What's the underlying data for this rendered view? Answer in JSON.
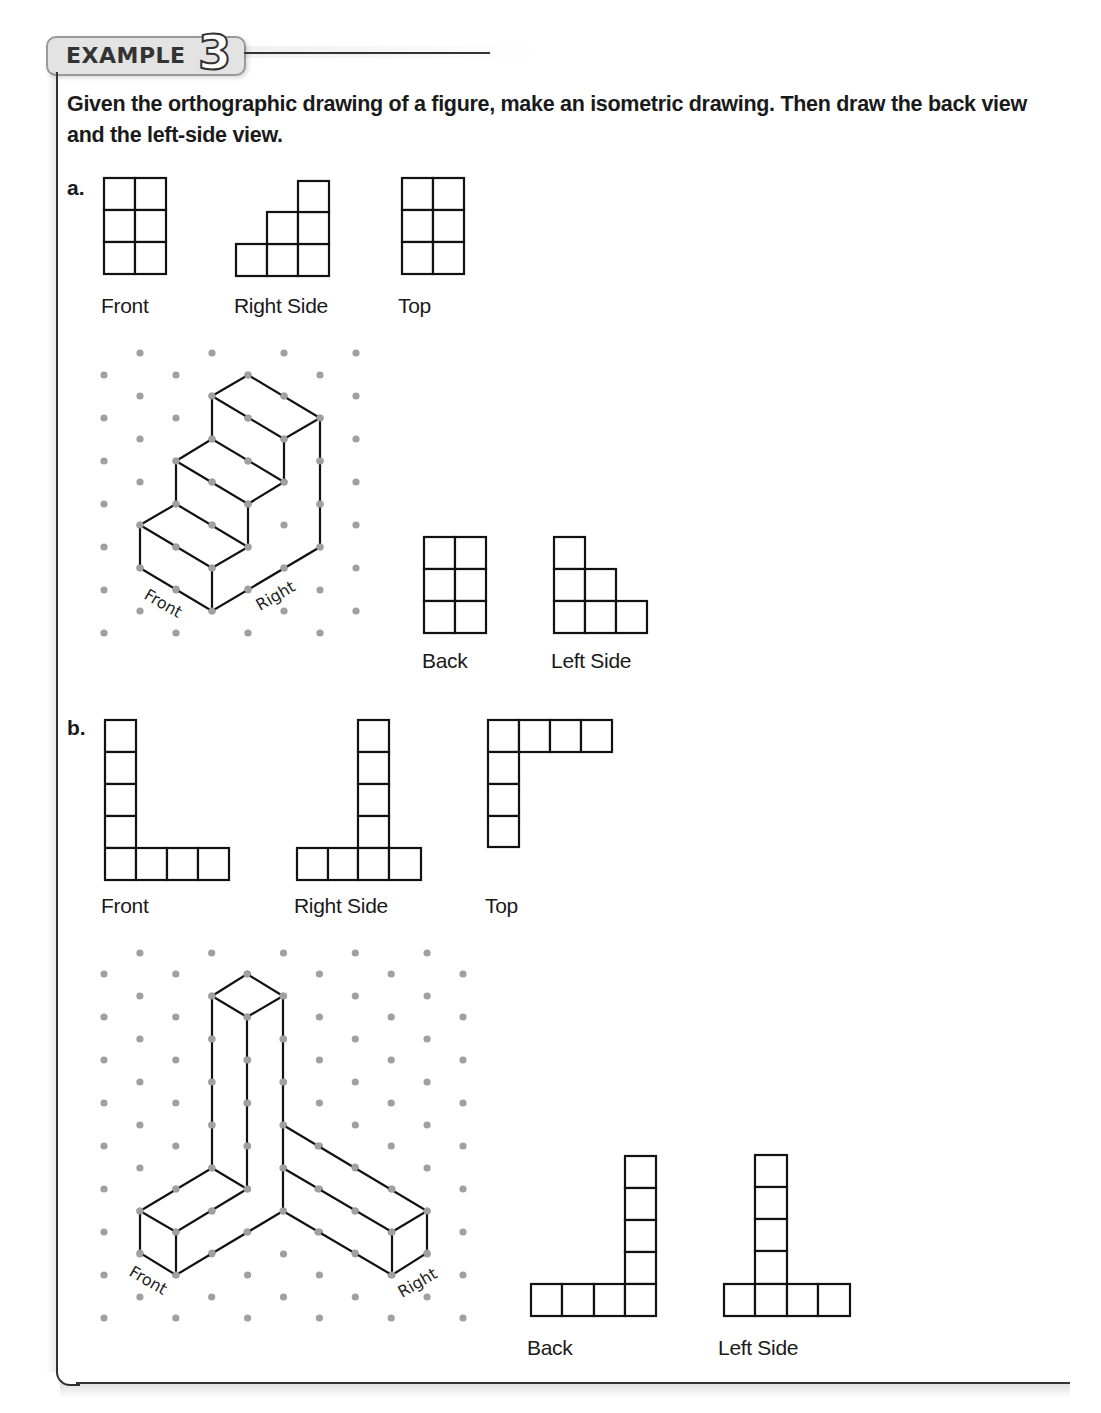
{
  "header": {
    "badge_label": "EXAMPLE",
    "badge_number": "3"
  },
  "instructions": "Given the orthographic drawing of a figure, make an isometric drawing. Then draw the back view and the left-side view.",
  "parts": [
    {
      "label": "a.",
      "given_views": [
        {
          "name": "Front",
          "layout": "2 columns x 3 rows"
        },
        {
          "name": "Right Side",
          "layout": "stairs: heights 1,2,3 left to right"
        },
        {
          "name": "Top",
          "layout": "2 columns x 3 rows"
        }
      ],
      "isometric": {
        "front_label": "Front",
        "right_label": "Right",
        "description": "three-step staircase"
      },
      "answer_views": [
        {
          "name": "Back",
          "layout": "2 columns x 3 rows"
        },
        {
          "name": "Left Side",
          "layout": "stairs: heights 3,2,1 left to right"
        }
      ]
    },
    {
      "label": "b.",
      "given_views": [
        {
          "name": "Front",
          "layout": "L: column of 5 on left, bottom row of 4"
        },
        {
          "name": "Right Side",
          "layout": "inverted T: column of 5 at 3rd position, bottom row of 4"
        },
        {
          "name": "Top",
          "layout": "row of 4 on top, column of 4 on left"
        }
      ],
      "isometric": {
        "front_label": "Front",
        "right_label": "Right",
        "description": "tower of 5 with two arms of length 4"
      },
      "answer_views": [
        {
          "name": "Back",
          "layout": "bottom row of 4, column of 5 on right"
        },
        {
          "name": "Left Side",
          "layout": "column of 5 at 2nd position, bottom row of 4"
        }
      ]
    }
  ],
  "colors": {
    "line": "#111111",
    "grid_dot": "#a0a0a0",
    "badge_fill": "#e3e3e3",
    "badge_border": "#9a9a9a"
  }
}
